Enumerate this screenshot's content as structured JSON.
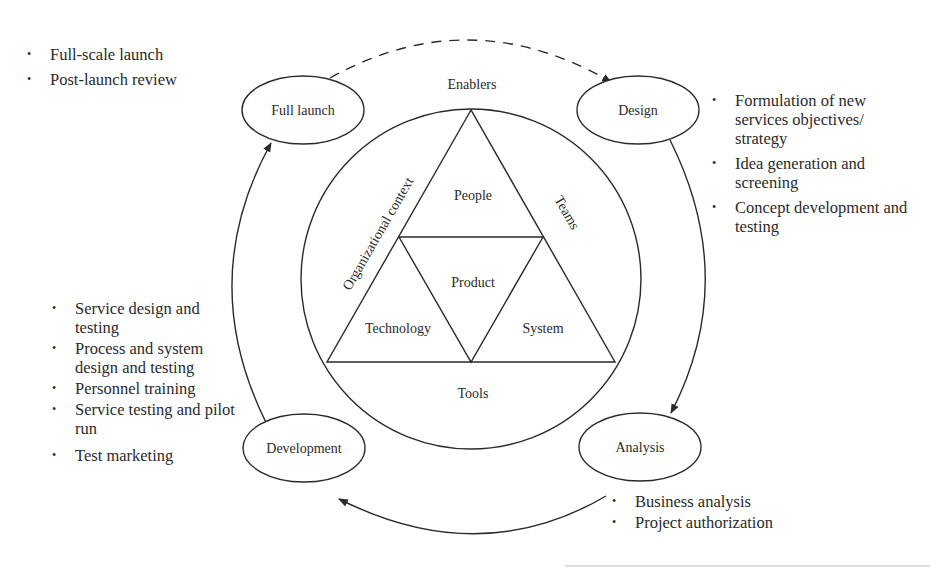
{
  "diagram": {
    "stages": [
      {
        "id": "full-launch",
        "label": "Full launch"
      },
      {
        "id": "design",
        "label": "Design"
      },
      {
        "id": "analysis",
        "label": "Analysis"
      },
      {
        "id": "development",
        "label": "Development"
      }
    ],
    "center": {
      "enablers_label": "Enablers",
      "org_context_label": "Organizational context",
      "teams_label": "Teams",
      "tools_label": "Tools",
      "triangle": {
        "top": "People",
        "middle": "Product",
        "left": "Technology",
        "right": "System"
      }
    },
    "bullets": {
      "full_launch": [
        "Full-scale launch",
        "Post-launch review"
      ],
      "design": [
        "Formulation of new services objectives/ strategy",
        "Idea generation and screening",
        "Concept development and testing"
      ],
      "development": [
        "Service design and testing",
        "Process and system design and testing",
        "Personnel training",
        "Service testing and pilot run",
        "Test marketing"
      ],
      "analysis": [
        "Business analysis",
        "Project authorization"
      ]
    },
    "connectors": [
      {
        "from": "full-launch",
        "to": "design",
        "style": "dashed"
      },
      {
        "from": "design",
        "to": "analysis",
        "style": "solid"
      },
      {
        "from": "analysis",
        "to": "development",
        "style": "solid"
      },
      {
        "from": "development",
        "to": "full-launch",
        "style": "solid"
      }
    ],
    "colors": {
      "stroke": "#2a2a2a",
      "background": "#ffffff"
    }
  }
}
